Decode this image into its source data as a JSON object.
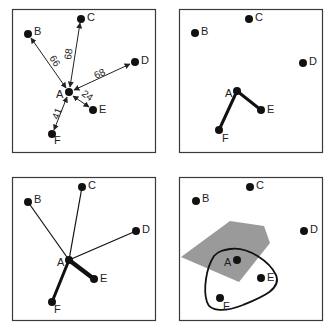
{
  "panels": [
    {
      "id": "weighted-arrows",
      "points": {
        "A": {
          "label": "A"
        },
        "B": {
          "label": "B"
        },
        "C": {
          "label": "C"
        },
        "D": {
          "label": "D"
        },
        "E": {
          "label": "E"
        },
        "F": {
          "label": "F"
        }
      },
      "edges": [
        {
          "from": "A",
          "to": "B",
          "weight": "66"
        },
        {
          "from": "A",
          "to": "C",
          "weight": "68"
        },
        {
          "from": "A",
          "to": "D",
          "weight": "68"
        },
        {
          "from": "A",
          "to": "E",
          "weight": "24"
        },
        {
          "from": "A",
          "to": "F",
          "weight": "41"
        }
      ]
    },
    {
      "id": "nearest-neighbors",
      "points": {
        "A": {
          "label": "A"
        },
        "B": {
          "label": "B"
        },
        "C": {
          "label": "C"
        },
        "D": {
          "label": "D"
        },
        "E": {
          "label": "E"
        },
        "F": {
          "label": "F"
        }
      },
      "edges": [
        {
          "from": "A",
          "to": "E",
          "style": "thick"
        },
        {
          "from": "A",
          "to": "F",
          "style": "thick"
        }
      ]
    },
    {
      "id": "weighted-lines",
      "points": {
        "A": {
          "label": "A"
        },
        "B": {
          "label": "B"
        },
        "C": {
          "label": "C"
        },
        "D": {
          "label": "D"
        },
        "E": {
          "label": "E"
        },
        "F": {
          "label": "F"
        }
      },
      "edges": [
        {
          "from": "A",
          "to": "B",
          "style": "thin"
        },
        {
          "from": "A",
          "to": "C",
          "style": "thin"
        },
        {
          "from": "A",
          "to": "D",
          "style": "thin"
        },
        {
          "from": "A",
          "to": "E",
          "style": "thickest"
        },
        {
          "from": "A",
          "to": "F",
          "style": "thick"
        }
      ]
    },
    {
      "id": "region-cluster",
      "points": {
        "A": {
          "label": "A"
        },
        "B": {
          "label": "B"
        },
        "C": {
          "label": "C"
        },
        "D": {
          "label": "D"
        },
        "E": {
          "label": "E"
        },
        "F": {
          "label": "F"
        }
      },
      "shaded_region": {
        "color": "#9a9a9a"
      },
      "cluster_outline": {
        "encloses": [
          "A",
          "E",
          "F"
        ]
      }
    }
  ],
  "colors": {
    "frame": "#3a3a3a",
    "point": "#111111",
    "region": "#9a9a9a",
    "background": "#ffffff"
  }
}
